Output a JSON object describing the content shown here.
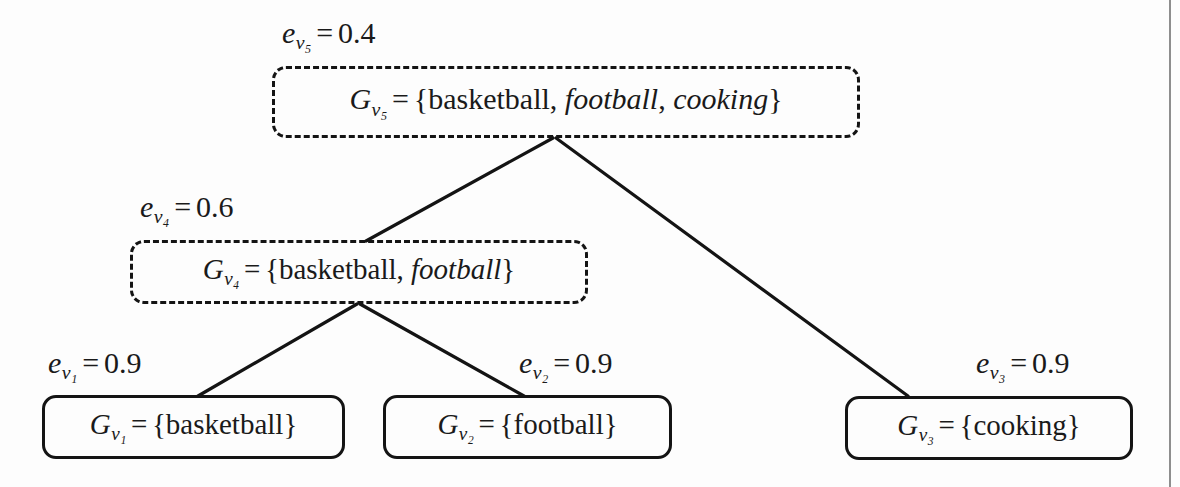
{
  "diagram": {
    "colors": {
      "ink": "#141414",
      "background": "#fdfdfd",
      "margin_rule": "#8e8e8e"
    },
    "nodes": [
      {
        "id": "v5",
        "role": "root",
        "border_style": "dashed",
        "weight_label": {
          "symbol": "e",
          "subscript": "v₅",
          "relation": "=",
          "value": "0.4",
          "text": "e_v5 = 0.4"
        },
        "group_symbol": "G",
        "group_subscript": "v₅",
        "relation": "=",
        "open_brace": "{",
        "close_brace": "}",
        "members": [
          {
            "text": "basketball",
            "style": "upright"
          },
          {
            "text": "football",
            "style": "italic"
          },
          {
            "text": "cooking",
            "style": "italic"
          }
        ],
        "members_text": "{basketball, football, cooking}",
        "full_text": "G_v5 = {basketball, football, cooking}"
      },
      {
        "id": "v4",
        "role": "internal",
        "border_style": "dashed",
        "weight_label": {
          "symbol": "e",
          "subscript": "v₄",
          "relation": "=",
          "value": "0.6",
          "text": "e_v4 = 0.6"
        },
        "group_symbol": "G",
        "group_subscript": "v₄",
        "relation": "=",
        "open_brace": "{",
        "close_brace": "}",
        "members": [
          {
            "text": "basketball",
            "style": "upright"
          },
          {
            "text": "football",
            "style": "italic"
          }
        ],
        "members_text": "{basketball, football}",
        "full_text": "G_v4 = {basketball, football}"
      },
      {
        "id": "v1",
        "role": "leaf",
        "border_style": "solid",
        "weight_label": {
          "symbol": "e",
          "subscript": "v₁",
          "relation": "=",
          "value": "0.9",
          "text": "e_v1 = 0.9"
        },
        "group_symbol": "G",
        "group_subscript": "v₁",
        "relation": "=",
        "open_brace": "{",
        "close_brace": "}",
        "members": [
          {
            "text": "basketball",
            "style": "upright"
          }
        ],
        "members_text": "{basketball}",
        "full_text": "G_v1 = {basketball}"
      },
      {
        "id": "v2",
        "role": "leaf",
        "border_style": "solid",
        "weight_label": {
          "symbol": "e",
          "subscript": "v₂",
          "relation": "=",
          "value": "0.9",
          "text": "e_v2 = 0.9"
        },
        "group_symbol": "G",
        "group_subscript": "v₂",
        "relation": "=",
        "open_brace": "{",
        "close_brace": "}",
        "members": [
          {
            "text": "football",
            "style": "upright"
          }
        ],
        "members_text": "{football}",
        "full_text": "G_v2 = {football}"
      },
      {
        "id": "v3",
        "role": "leaf",
        "border_style": "solid",
        "weight_label": {
          "symbol": "e",
          "subscript": "v₃",
          "relation": "=",
          "value": "0.9",
          "text": "e_v3 = 0.9"
        },
        "group_symbol": "G",
        "group_subscript": "v₃",
        "relation": "=",
        "open_brace": "{",
        "close_brace": "}",
        "members": [
          {
            "text": "cooking",
            "style": "upright"
          }
        ],
        "members_text": "{cooking}",
        "full_text": "G_v3 = {cooking}"
      }
    ],
    "edges": [
      {
        "from": "v5",
        "to": "v4"
      },
      {
        "from": "v5",
        "to": "v3"
      },
      {
        "from": "v4",
        "to": "v1"
      },
      {
        "from": "v4",
        "to": "v2"
      }
    ]
  }
}
